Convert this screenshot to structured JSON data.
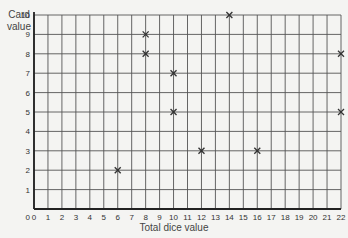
{
  "chart_data": {
    "type": "scatter",
    "title": "",
    "xlabel": "Total dice value",
    "ylabel": "Card value",
    "xlim": [
      0,
      22
    ],
    "ylim": [
      0,
      10
    ],
    "x_ticks": [
      0,
      1,
      2,
      3,
      4,
      5,
      6,
      7,
      8,
      9,
      10,
      11,
      12,
      13,
      14,
      15,
      16,
      17,
      18,
      19,
      20,
      21,
      22
    ],
    "y_ticks": [
      0,
      1,
      2,
      3,
      4,
      5,
      6,
      7,
      8,
      9,
      10
    ],
    "grid": true,
    "marker": "x",
    "points": [
      {
        "x": 6,
        "y": 2
      },
      {
        "x": 8,
        "y": 9
      },
      {
        "x": 8,
        "y": 8
      },
      {
        "x": 10,
        "y": 7
      },
      {
        "x": 10,
        "y": 5
      },
      {
        "x": 12,
        "y": 3
      },
      {
        "x": 14,
        "y": 10
      },
      {
        "x": 16,
        "y": 3
      },
      {
        "x": 22,
        "y": 8
      },
      {
        "x": 22,
        "y": 5
      }
    ]
  },
  "labels": {
    "ylabel_line1": "Card",
    "ylabel_line2": "value",
    "xlabel": "Total dice value"
  },
  "colors": {
    "grid": "#555555",
    "axis": "#222222",
    "marker": "#333333",
    "background": "#f4f4f2"
  }
}
